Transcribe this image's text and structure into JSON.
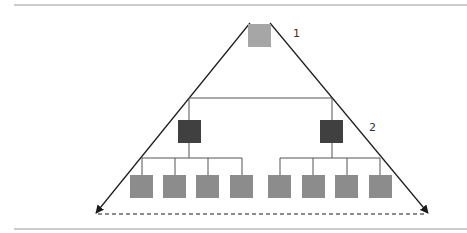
{
  "diagram": {
    "title": "",
    "levels": [
      {
        "label": "1",
        "nodes": [
          {
            "id": "top",
            "color": "#a6a6a6"
          }
        ]
      },
      {
        "label": "2",
        "nodes": [
          {
            "id": "mid-left",
            "color": "#404040"
          },
          {
            "id": "mid-right",
            "color": "#404040"
          }
        ]
      },
      {
        "label": "",
        "nodes": [
          {
            "id": "leaf-1",
            "color": "#8c8c8c"
          },
          {
            "id": "leaf-2",
            "color": "#8c8c8c"
          },
          {
            "id": "leaf-3",
            "color": "#8c8c8c"
          },
          {
            "id": "leaf-4",
            "color": "#8c8c8c"
          },
          {
            "id": "leaf-5",
            "color": "#8c8c8c"
          },
          {
            "id": "leaf-6",
            "color": "#8c8c8c"
          },
          {
            "id": "leaf-7",
            "color": "#8c8c8c"
          },
          {
            "id": "leaf-8",
            "color": "#8c8c8c"
          }
        ]
      }
    ],
    "colors": {
      "top_node": "#a6a6a6",
      "mid_node": "#404040",
      "leaf_node": "#8c8c8c",
      "connector": "#555555",
      "triangle": "#1a1a1a",
      "border": "#9a9a9a"
    }
  }
}
